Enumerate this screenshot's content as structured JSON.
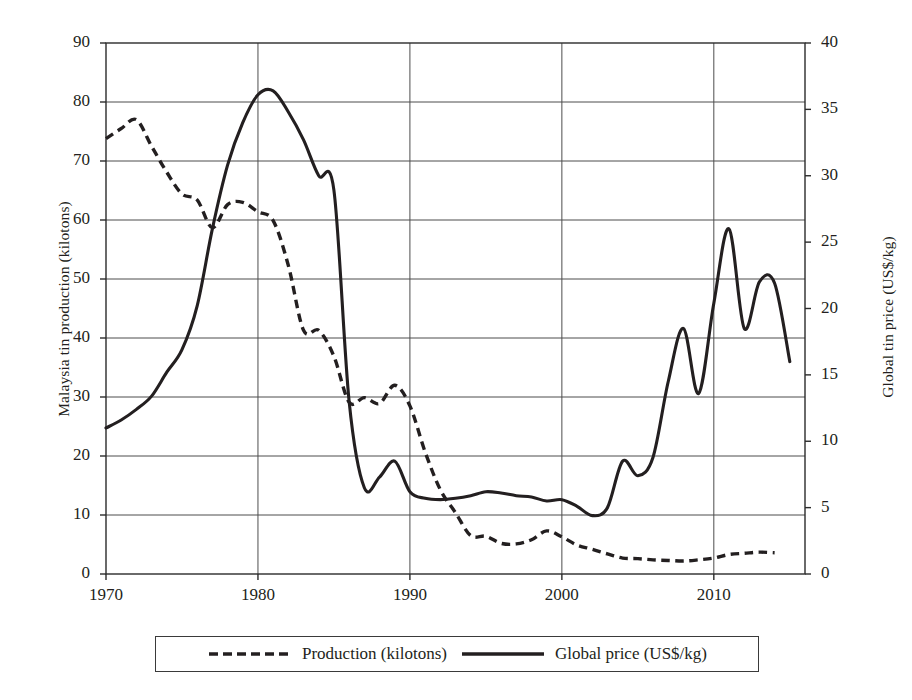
{
  "chart_data": {
    "type": "line",
    "title": "",
    "xlabel": "",
    "xlim": [
      1970,
      2016
    ],
    "grid": true,
    "legend_position": "bottom",
    "x_ticks": [
      "1970",
      "1980",
      "1990",
      "2000",
      "2010"
    ],
    "x_tick_values": [
      1970,
      1980,
      1990,
      2000,
      2010
    ],
    "axes": [
      {
        "id": "left",
        "label": "Malaysia tin production (kilotons)",
        "ylim": [
          0,
          90
        ],
        "ticks": [
          "0",
          "10",
          "20",
          "30",
          "40",
          "50",
          "60",
          "70",
          "80",
          "90"
        ],
        "tick_values": [
          0,
          10,
          20,
          30,
          40,
          50,
          60,
          70,
          80,
          90
        ]
      },
      {
        "id": "right",
        "label": "Global tin price (US$/kg)",
        "ylim": [
          0,
          40
        ],
        "ticks": [
          "0",
          "5",
          "10",
          "15",
          "20",
          "25",
          "30",
          "35",
          "40"
        ],
        "tick_values": [
          0,
          5,
          10,
          15,
          20,
          25,
          30,
          35,
          40
        ]
      }
    ],
    "series": [
      {
        "name": "Production (kilotons)",
        "axis": "left",
        "style": "dashed",
        "color": "#231f20",
        "x": [
          1970,
          1971,
          1972,
          1973,
          1974,
          1975,
          1976,
          1977,
          1978,
          1979,
          1980,
          1981,
          1982,
          1983,
          1984,
          1985,
          1986,
          1987,
          1988,
          1989,
          1990,
          1991,
          1992,
          1993,
          1994,
          1995,
          1996,
          1997,
          1998,
          1999,
          2000,
          2001,
          2002,
          2003,
          2004,
          2005,
          2006,
          2007,
          2008,
          2009,
          2010,
          2011,
          2012,
          2013,
          2014
        ],
        "values": [
          73.8,
          75.5,
          77.0,
          72.5,
          68.1,
          64.4,
          63.4,
          58.7,
          62.6,
          63.0,
          61.4,
          59.9,
          52.3,
          41.3,
          41.3,
          36.9,
          29.1,
          29.9,
          28.9,
          32.0,
          28.5,
          20.7,
          14.3,
          10.4,
          6.5,
          6.4,
          5.2,
          5.1,
          5.8,
          7.3,
          6.3,
          4.9,
          4.2,
          3.4,
          2.7,
          2.6,
          2.4,
          2.3,
          2.2,
          2.4,
          2.7,
          3.3,
          3.5,
          3.7,
          3.6
        ]
      },
      {
        "name": "Global price (US$/kg)",
        "axis": "right",
        "style": "solid",
        "color": "#231f20",
        "x": [
          1970,
          1971,
          1972,
          1973,
          1974,
          1975,
          1976,
          1977,
          1978,
          1979,
          1980,
          1981,
          1982,
          1983,
          1984,
          1985,
          1986,
          1987,
          1988,
          1989,
          1990,
          1991,
          1992,
          1993,
          1994,
          1995,
          1996,
          1997,
          1998,
          1999,
          2000,
          2001,
          2002,
          2003,
          2004,
          2005,
          2006,
          2007,
          2008,
          2009,
          2010,
          2011,
          2012,
          2013,
          2014,
          2015
        ],
        "values": [
          11.0,
          11.6,
          12.4,
          13.4,
          15.2,
          16.9,
          20.2,
          26.0,
          30.8,
          34.0,
          36.1,
          36.4,
          34.8,
          32.7,
          30.0,
          28.9,
          13.0,
          6.5,
          7.3,
          8.5,
          6.2,
          5.7,
          5.6,
          5.7,
          5.9,
          6.2,
          6.1,
          5.9,
          5.8,
          5.5,
          5.6,
          5.1,
          4.4,
          5.0,
          8.5,
          7.4,
          8.8,
          14.5,
          18.5,
          13.6,
          20.4,
          26.0,
          18.5,
          22.0,
          21.9,
          16.0
        ]
      }
    ],
    "annotations": []
  },
  "legend": {
    "entries": [
      {
        "label": "Production (kilotons)",
        "style": "dashed"
      },
      {
        "label": "Global price (US$/kg)",
        "style": "solid"
      }
    ]
  },
  "colors": {
    "ink": "#231f20",
    "grid": "#4d4d4d",
    "axis": "#2b2b2b",
    "background": "#ffffff"
  }
}
